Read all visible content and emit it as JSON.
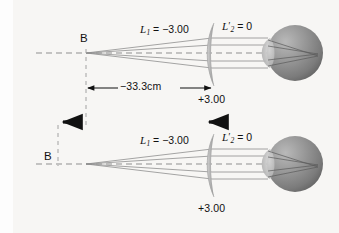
{
  "figure": {
    "background_color": "#f7f6f4",
    "ink_color": "#111111",
    "ray_color": "#8a8a8a",
    "axis_color": "#9a9a9a",
    "lens_color": "#b4b4b4",
    "eye_color": "#8d8d8d"
  },
  "top_system": {
    "object_label": "B",
    "incident_vergence_label": {
      "symbol": "L",
      "subscript": "1",
      "prime": "",
      "equals": "=",
      "value": "−3.00",
      "full": "L1 = −3.00"
    },
    "exit_vergence_label": {
      "symbol": "L",
      "subscript": "2",
      "prime": "′",
      "equals": "=",
      "value": "0",
      "full": "L'2 = 0"
    },
    "lens_power_label": "+3.00"
  },
  "bottom_system": {
    "object_label": "B",
    "incident_vergence_label": {
      "symbol": "L",
      "subscript": "1",
      "prime": "",
      "equals": "=",
      "value": "−3.00",
      "full": "L1 = −3.00"
    },
    "exit_vergence_label": {
      "symbol": "L",
      "subscript": "2",
      "prime": "′",
      "equals": "=",
      "value": "0",
      "full": "L'2 = 0"
    },
    "lens_power_label": "+3.00"
  },
  "dimension": {
    "label": "−33.3cm",
    "arrow_style": "double-headed"
  },
  "motion_arrows": {
    "count": 2,
    "direction": "left",
    "left_arrow_name": "object-shift-arrow",
    "right_arrow_name": "lens-shift-arrow"
  }
}
